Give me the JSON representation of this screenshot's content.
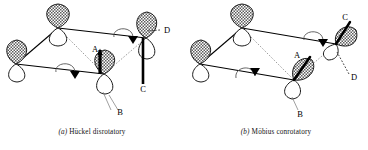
{
  "figure": {
    "kind": "orbital-correlation-diagram",
    "ink_color": "#000000",
    "paper_color": "#ffffff",
    "shaded_lobe_fill": "#9a9a9a",
    "open_lobe_fill": "#ffffff"
  },
  "panels": [
    {
      "id": "panel-a",
      "caption_tag": "(a)",
      "caption_text": "Hückel disrotatory",
      "caption_full": "(a)  Hückel disrotatory",
      "mode": "disrotatory",
      "labels": [
        {
          "id": "label-a",
          "text": "A",
          "x": 95,
          "y": 52
        },
        {
          "id": "label-b",
          "text": "B",
          "x": 118,
          "y": 112
        },
        {
          "id": "label-c",
          "text": "C",
          "x": 142,
          "y": 89
        },
        {
          "id": "label-d",
          "text": "D",
          "x": 166,
          "y": 33
        }
      ],
      "rotation_arrows": [
        {
          "id": "arrow-rear-right",
          "sense": "clockwise"
        },
        {
          "id": "arrow-front-left",
          "sense": "counterclockwise"
        }
      ],
      "orbitals": [
        {
          "id": "orbital-rear-left",
          "shaded_lobe": "up"
        },
        {
          "id": "orbital-rear-right",
          "shaded_lobe": "up"
        },
        {
          "id": "orbital-front-left",
          "shaded_lobe": "up"
        },
        {
          "id": "orbital-front-right",
          "shaded_lobe": "up"
        }
      ]
    },
    {
      "id": "panel-b",
      "caption_tag": "(b)",
      "caption_text": "Möbius conrotatory",
      "caption_full": "(b)  Möbius conrotatory",
      "mode": "conrotatory",
      "labels": [
        {
          "id": "label-a",
          "text": "A",
          "x": 113,
          "y": 57
        },
        {
          "id": "label-b",
          "text": "B",
          "x": 116,
          "y": 113
        },
        {
          "id": "label-c",
          "text": "C",
          "x": 159,
          "y": 20
        },
        {
          "id": "label-d",
          "text": "D",
          "x": 168,
          "y": 78
        }
      ],
      "rotation_arrows": [
        {
          "id": "arrow-rear-right",
          "sense": "clockwise"
        },
        {
          "id": "arrow-front-left",
          "sense": "clockwise"
        }
      ],
      "orbitals": [
        {
          "id": "orbital-rear-left",
          "shaded_lobe": "up"
        },
        {
          "id": "orbital-rear-right",
          "shaded_lobe": "up"
        },
        {
          "id": "orbital-front-left",
          "shaded_lobe": "up"
        },
        {
          "id": "orbital-front-right",
          "shaded_lobe": "tilted"
        }
      ]
    }
  ]
}
